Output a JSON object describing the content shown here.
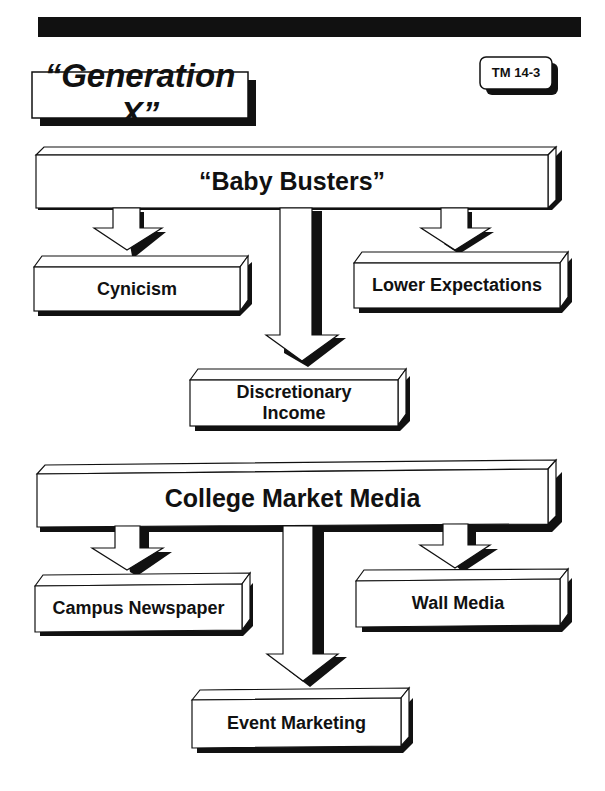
{
  "header": {
    "title": "“Generation X”",
    "slide_id": "TM 14-3"
  },
  "section1": {
    "main": "“Baby Busters”",
    "children": [
      "Cynicism",
      "Lower Expectations",
      "Discretionary Income"
    ]
  },
  "section2": {
    "main": "College Market Media",
    "children": [
      "Campus Newspaper",
      "Wall Media",
      "Event Marketing"
    ]
  },
  "colors": {
    "ink": "#111111",
    "paper": "#ffffff"
  }
}
